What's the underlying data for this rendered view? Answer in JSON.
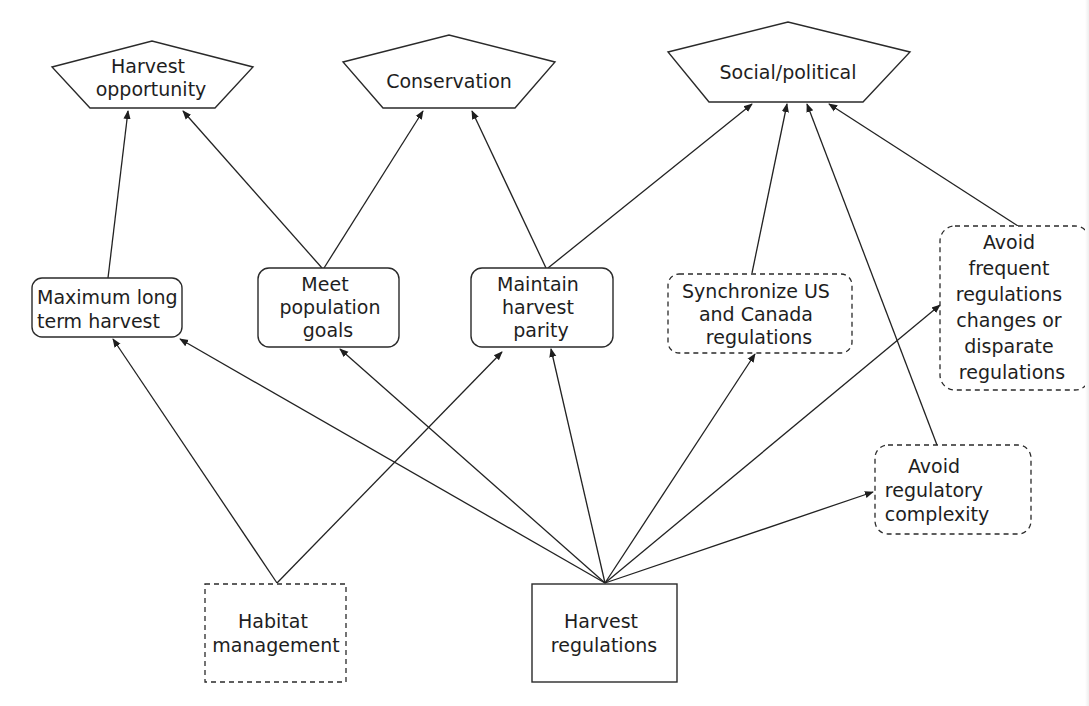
{
  "diagram": {
    "type": "influence-diagram",
    "objectives": {
      "harvest_opportunity": {
        "lines": [
          "Harvest",
          "opportunity"
        ],
        "shape": "pentagon"
      },
      "conservation": {
        "lines": [
          "Conservation"
        ],
        "shape": "pentagon"
      },
      "social_political": {
        "lines": [
          "Social/political"
        ],
        "shape": "pentagon"
      }
    },
    "means": {
      "max_long_term_harvest": {
        "lines": [
          "Maximum long",
          "term harvest"
        ],
        "shape": "rounded-rect",
        "border": "solid"
      },
      "meet_population_goals": {
        "lines": [
          "Meet",
          "population",
          "goals"
        ],
        "shape": "rounded-rect",
        "border": "solid"
      },
      "maintain_harvest_parity": {
        "lines": [
          "Maintain",
          "harvest",
          "parity"
        ],
        "shape": "rounded-rect",
        "border": "solid"
      },
      "synchronize_us_canada": {
        "lines": [
          "Synchronize US",
          "and Canada",
          "regulations"
        ],
        "shape": "rounded-rect",
        "border": "dashed"
      },
      "avoid_frequent_changes": {
        "lines": [
          "Avoid",
          "frequent",
          "regulations",
          "changes or",
          "disparate",
          "regulations"
        ],
        "shape": "rounded-rect",
        "border": "dashed"
      },
      "avoid_regulatory_complexity": {
        "lines": [
          "Avoid",
          "regulatory",
          "complexity"
        ],
        "shape": "rounded-rect",
        "border": "dashed"
      }
    },
    "decisions": {
      "habitat_management": {
        "lines": [
          "Habitat",
          "management"
        ],
        "shape": "rect",
        "border": "dashed"
      },
      "harvest_regulations": {
        "lines": [
          "Harvest",
          "regulations"
        ],
        "shape": "rect",
        "border": "solid"
      }
    },
    "edges": [
      {
        "from": "max_long_term_harvest",
        "to": "harvest_opportunity"
      },
      {
        "from": "meet_population_goals",
        "to": "harvest_opportunity"
      },
      {
        "from": "meet_population_goals",
        "to": "conservation"
      },
      {
        "from": "maintain_harvest_parity",
        "to": "conservation"
      },
      {
        "from": "maintain_harvest_parity",
        "to": "social_political"
      },
      {
        "from": "synchronize_us_canada",
        "to": "social_political"
      },
      {
        "from": "avoid_regulatory_complexity",
        "to": "social_political"
      },
      {
        "from": "avoid_frequent_changes",
        "to": "social_political"
      },
      {
        "from": "habitat_management",
        "to": "max_long_term_harvest"
      },
      {
        "from": "habitat_management",
        "to": "maintain_harvest_parity"
      },
      {
        "from": "harvest_regulations",
        "to": "max_long_term_harvest"
      },
      {
        "from": "harvest_regulations",
        "to": "meet_population_goals"
      },
      {
        "from": "harvest_regulations",
        "to": "maintain_harvest_parity"
      },
      {
        "from": "harvest_regulations",
        "to": "synchronize_us_canada"
      },
      {
        "from": "harvest_regulations",
        "to": "avoid_frequent_changes"
      },
      {
        "from": "harvest_regulations",
        "to": "avoid_regulatory_complexity"
      }
    ]
  }
}
